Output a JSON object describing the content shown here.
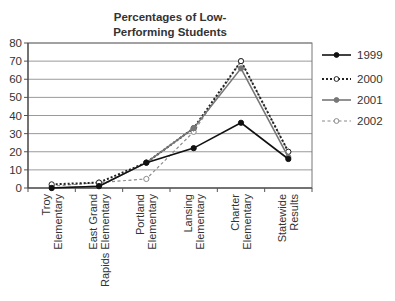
{
  "chart_data": {
    "type": "line",
    "title_lines": [
      "Percentages of Low-",
      "Performing Students"
    ],
    "xlabel": "",
    "ylabel": "",
    "ylim": [
      0,
      80
    ],
    "yticks": [
      0,
      10,
      20,
      30,
      40,
      50,
      60,
      70,
      80
    ],
    "grid": true,
    "legend_position": "right",
    "categories": [
      "Troy Elementary",
      "East Grand Rapids Elementary",
      "Portland Elementary",
      "Lansing Elementary",
      "Charter Elementary",
      "Statewide Results"
    ],
    "category_lines": [
      [
        "Troy",
        "Elementary"
      ],
      [
        "East Grand",
        "Rapids Elementary"
      ],
      [
        "Portland",
        "Elementary"
      ],
      [
        "Lansing",
        "Elementary"
      ],
      [
        "Charter",
        "Elementary"
      ],
      [
        "Statewide",
        "Results"
      ]
    ],
    "series": [
      {
        "name": "1999",
        "values": [
          0,
          1,
          14,
          22,
          36,
          16
        ],
        "style": "solid",
        "marker": "filled-circle",
        "color": "#111111"
      },
      {
        "name": "2000",
        "values": [
          2,
          3,
          14,
          33,
          70,
          20
        ],
        "style": "dotted",
        "marker": "open-circle",
        "color": "#222222"
      },
      {
        "name": "2001",
        "values": [
          0,
          1,
          14,
          33,
          66,
          17
        ],
        "style": "solid",
        "marker": "filled-circle",
        "color": "#777777"
      },
      {
        "name": "2002",
        "values": [
          1,
          3,
          5,
          31,
          70,
          20
        ],
        "style": "dashed",
        "marker": "open-circle",
        "color": "#8a8a8a"
      }
    ]
  }
}
